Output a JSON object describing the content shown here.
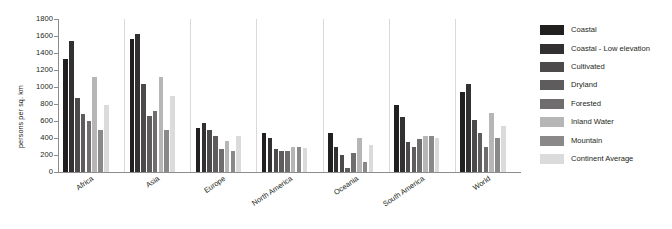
{
  "chart_data": {
    "type": "bar",
    "title": "",
    "subtitle": "",
    "xlabel": "",
    "ylabel": "persons per sq. km",
    "ylim": [
      0,
      1800
    ],
    "ytick_step": 200,
    "yticks": [
      0,
      200,
      400,
      600,
      800,
      1000,
      1200,
      1400,
      1600,
      1800
    ],
    "ytick_labels": [
      "0",
      "200",
      "400",
      "600",
      "800",
      "1000",
      "1200",
      "1400",
      "1600",
      "1800"
    ],
    "grid": false,
    "legend_position": "right",
    "categories": [
      "Africa",
      "Asia",
      "Europe",
      "North America",
      "Oceania",
      "South America",
      "World"
    ],
    "series": [
      {
        "name": "Coastal",
        "color": "#221f1f",
        "values": [
          1325,
          1560,
          520,
          460,
          455,
          790,
          940
        ]
      },
      {
        "name": "Coastal - Low elevation",
        "color": "#333031",
        "values": [
          1540,
          1620,
          575,
          400,
          300,
          650,
          1040
        ]
      },
      {
        "name": "Cultivated",
        "color": "#4c4a4b",
        "values": [
          870,
          1040,
          500,
          270,
          200,
          350,
          610
        ]
      },
      {
        "name": "Dryland",
        "color": "#5e5c5d",
        "values": [
          685,
          660,
          420,
          250,
          45,
          300,
          460
        ]
      },
      {
        "name": "Forested",
        "color": "#6f6d6e",
        "values": [
          605,
          720,
          270,
          245,
          225,
          390,
          290
        ]
      },
      {
        "name": "Inland Water",
        "color": "#b7b6b6",
        "values": [
          1120,
          1120,
          360,
          300,
          400,
          420,
          700
        ]
      },
      {
        "name": "Mountain",
        "color": "#8a8889",
        "values": [
          495,
          500,
          250,
          300,
          120,
          420,
          400
        ]
      },
      {
        "name": "Continent Average",
        "color": "#dcdbdb",
        "values": [
          790,
          900,
          420,
          280,
          320,
          400,
          540
        ]
      }
    ]
  },
  "legend": {
    "items": [
      {
        "label": "Coastal"
      },
      {
        "label": "Coastal - Low elevation"
      },
      {
        "label": "Cultivated"
      },
      {
        "label": "Dryland"
      },
      {
        "label": "Forested"
      },
      {
        "label": "Inland Water"
      },
      {
        "label": "Mountain"
      },
      {
        "label": "Continent Average"
      }
    ]
  }
}
